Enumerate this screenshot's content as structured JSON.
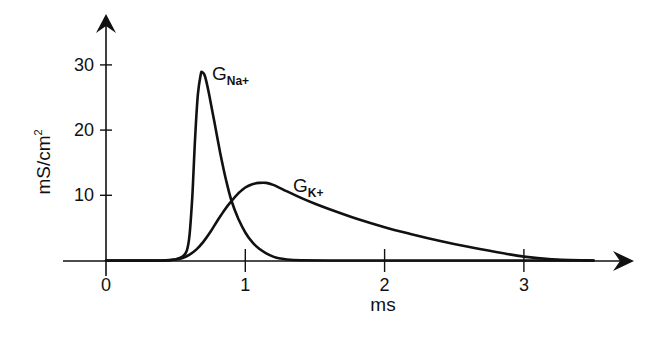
{
  "chart_data": {
    "type": "line",
    "title": "",
    "xlabel": "ms",
    "ylabel": "mS/cm²",
    "xlim": [
      -0.31,
      3.8
    ],
    "ylim": [
      0,
      38
    ],
    "x_ticks": [
      0,
      1,
      2,
      3
    ],
    "x_tick_labels": [
      "0",
      "1",
      "2",
      "3"
    ],
    "y_ticks": [
      10,
      20,
      30
    ],
    "y_tick_labels": [
      "10",
      "20",
      "30"
    ],
    "grid": false,
    "legend": "inline labels",
    "series": [
      {
        "name": "G_Na+",
        "label_main": "G",
        "label_sub": "Na+",
        "x": [
          0.0,
          0.4,
          0.5,
          0.55,
          0.58,
          0.6,
          0.62,
          0.64,
          0.66,
          0.68,
          0.69,
          0.71,
          0.74,
          0.78,
          0.82,
          0.86,
          0.9,
          0.95,
          1.0,
          1.05,
          1.1,
          1.15,
          1.2,
          1.25,
          1.3,
          1.4,
          1.6,
          2.0,
          3.5
        ],
        "values": [
          0,
          0,
          0.2,
          0.6,
          1.5,
          4,
          10,
          19,
          25.5,
          28.5,
          28.9,
          28.3,
          25.5,
          21,
          16.5,
          12.5,
          9.2,
          6.4,
          4.3,
          2.8,
          1.8,
          1.1,
          0.6,
          0.3,
          0.15,
          0.05,
          0,
          0,
          0
        ]
      },
      {
        "name": "G_K+",
        "label_main": "G",
        "label_sub": "K+",
        "x": [
          0.0,
          0.4,
          0.5,
          0.55,
          0.6,
          0.65,
          0.7,
          0.75,
          0.8,
          0.85,
          0.9,
          0.95,
          1.0,
          1.05,
          1.1,
          1.15,
          1.2,
          1.3,
          1.4,
          1.5,
          1.6,
          1.8,
          2.0,
          2.2,
          2.4,
          2.6,
          2.8,
          3.0,
          3.2,
          3.5
        ],
        "values": [
          0,
          0,
          0.15,
          0.4,
          0.9,
          1.7,
          2.9,
          4.4,
          6.1,
          7.7,
          9.1,
          10.3,
          11.2,
          11.7,
          11.9,
          11.9,
          11.6,
          10.6,
          9.6,
          8.7,
          7.9,
          6.4,
          5.1,
          4.0,
          3.0,
          2.1,
          1.3,
          0.6,
          0.2,
          0
        ]
      }
    ]
  },
  "labels": {
    "ylabel": "mS/cm",
    "ylabel_sup": "2",
    "xlabel": "ms",
    "na_main": "G",
    "na_sub": "Na+",
    "k_main": "G",
    "k_sub": "K+",
    "x_ticks": [
      "0",
      "1",
      "2",
      "3"
    ],
    "y_ticks": [
      "10",
      "20",
      "30"
    ]
  },
  "colors": {
    "ink": "#111111",
    "background": "#ffffff"
  }
}
